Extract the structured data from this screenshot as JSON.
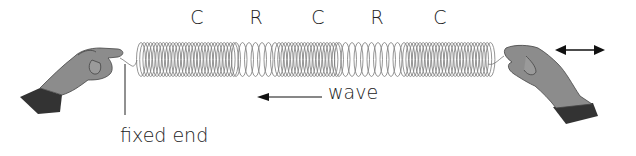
{
  "diagram": {
    "type": "longitudinal-wave-slinky",
    "region_labels": [
      {
        "text": "C",
        "x": 197
      },
      {
        "text": "R",
        "x": 256
      },
      {
        "text": "C",
        "x": 318
      },
      {
        "text": "R",
        "x": 377
      },
      {
        "text": "C",
        "x": 440
      }
    ],
    "wave_label": "wave",
    "fixed_end_label": "fixed end",
    "icons": [
      "left-hand-icon",
      "right-hand-icon",
      "double-arrow-icon",
      "wave-direction-arrow-icon",
      "spring-icon"
    ],
    "colors": {
      "ink": "#222222",
      "hand": "#8a8a8a",
      "cuff": "#333333",
      "spring": "#777777"
    }
  }
}
